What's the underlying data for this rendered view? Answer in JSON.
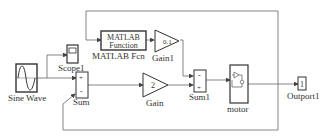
{
  "diagram": {
    "type": "simulink-block-diagram",
    "blocks": [
      {
        "id": "sine",
        "label": "Sine Wave"
      },
      {
        "id": "scope",
        "label": "Scope1"
      },
      {
        "id": "sum",
        "label": "Sum",
        "signs": [
          "+",
          "-"
        ]
      },
      {
        "id": "fcn",
        "label": "MATLAB Fcn",
        "text_line1": "MATLAB",
        "text_line2": "Function"
      },
      {
        "id": "gain1",
        "label": "Gain1",
        "value": "0.1"
      },
      {
        "id": "gain",
        "label": "Gain",
        "value": "2"
      },
      {
        "id": "sum1",
        "label": "Sum1",
        "signs": [
          "-",
          "+"
        ]
      },
      {
        "id": "motor",
        "label": "motor"
      },
      {
        "id": "outport",
        "label": "Outport1",
        "value": "1"
      }
    ],
    "colors": {
      "line": "#555555",
      "block_border": "#333333",
      "background": "#ffffff"
    }
  }
}
